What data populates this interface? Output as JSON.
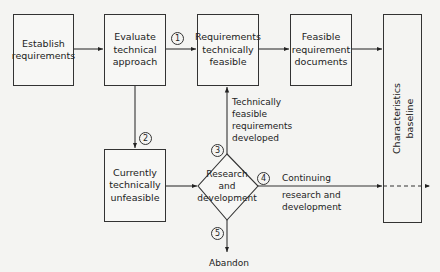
{
  "diagram": {
    "boxes": {
      "establish": "Establish requirements",
      "evaluate": "Evaluate technical approach",
      "feasible": "Requirements technically feasible",
      "documents": "Feasible requirement documents",
      "unfeasible": "Currently technically unfeasible",
      "baseline_line1": "Characteristics",
      "baseline_line2": "baseline"
    },
    "decision": {
      "line1": "Research",
      "line2": "and",
      "line3": "development"
    },
    "markers": [
      "1",
      "2",
      "3",
      "4",
      "5"
    ],
    "labels": {
      "developed_1": "Technically",
      "developed_2": "feasible",
      "developed_3": "requirements",
      "developed_4": "developed",
      "continuing_1": "Continuing",
      "continuing_2": "research and",
      "continuing_3": "development",
      "abandon": "Abandon"
    }
  }
}
